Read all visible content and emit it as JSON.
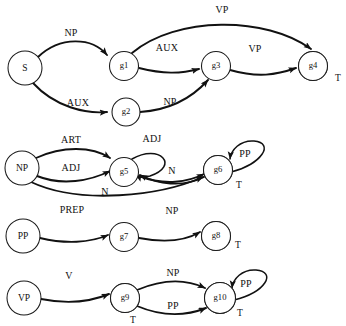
{
  "figure": {
    "kind": "recursive-transition-network",
    "background_color": "#ffffff",
    "node_fill": "#ffffff",
    "node_stroke": "#1a1a1a",
    "node_shade_color": "#b9b9b9",
    "edge_color": "#111111",
    "terminal_marker": "T"
  },
  "networks": [
    {
      "id": "s-network",
      "name": "S network",
      "nodes": [
        {
          "id": "S",
          "label": "S",
          "cx": 25,
          "cy": 68,
          "r": 17,
          "terminal": false
        },
        {
          "id": "g1",
          "label": "g1",
          "cx": 124,
          "cy": 66,
          "r": 14.5,
          "terminal": false
        },
        {
          "id": "g2",
          "label": "g2",
          "cx": 126,
          "cy": 112,
          "r": 14,
          "terminal": false
        },
        {
          "id": "g3",
          "label": "g3",
          "cx": 216,
          "cy": 66,
          "r": 14.5,
          "terminal": false
        },
        {
          "id": "g4",
          "label": "g4",
          "cx": 313,
          "cy": 66,
          "r": 14.5,
          "terminal": true,
          "terminal_label": "T",
          "terminal_label_x": 338,
          "terminal_label_y": 79
        }
      ],
      "edges": [
        {
          "from": "S",
          "to": "g1",
          "label": "NP",
          "label_x": 71,
          "label_y": 34
        },
        {
          "from": "S",
          "to": "g2",
          "label": "AUX",
          "label_x": 78,
          "label_y": 104
        },
        {
          "from": "g1",
          "to": "g3",
          "label": "AUX",
          "label_x": 167,
          "label_y": 49
        },
        {
          "from": "g1",
          "to": "g4",
          "label": "VP",
          "label_x": 222,
          "label_y": 11
        },
        {
          "from": "g2",
          "to": "g3",
          "label": "NP",
          "label_x": 170,
          "label_y": 103
        },
        {
          "from": "g3",
          "to": "g4",
          "label": "VP",
          "label_x": 255,
          "label_y": 50
        }
      ]
    },
    {
      "id": "np-network",
      "name": "NP network",
      "nodes": [
        {
          "id": "NP",
          "label": "NP",
          "cx": 22,
          "cy": 168,
          "r": 17,
          "terminal": false
        },
        {
          "id": "g5",
          "label": "g5",
          "cx": 124,
          "cy": 172,
          "r": 14.5,
          "terminal": false
        },
        {
          "id": "g6",
          "label": "g6",
          "cx": 218,
          "cy": 170,
          "r": 14.5,
          "terminal": true,
          "terminal_label": "T",
          "terminal_label_x": 239,
          "terminal_label_y": 186
        }
      ],
      "edges": [
        {
          "from": "NP",
          "to": "g5",
          "label": "ART",
          "label_x": 71,
          "label_y": 141
        },
        {
          "from": "NP",
          "to": "g5",
          "label": "ADJ",
          "label_x": 71,
          "label_y": 169
        },
        {
          "from": "NP",
          "to": "g6",
          "label": "N",
          "label_x": 105,
          "label_y": 193
        },
        {
          "from": "g5",
          "to": "g5",
          "label": "ADJ",
          "label_x": 152,
          "label_y": 140
        },
        {
          "from": "g5",
          "to": "g6",
          "label": "N",
          "label_x": 172,
          "label_y": 172
        },
        {
          "from": "g6",
          "to": "g6",
          "label": "PP",
          "label_x": 245,
          "label_y": 155
        }
      ]
    },
    {
      "id": "pp-network",
      "name": "PP network",
      "nodes": [
        {
          "id": "PP",
          "label": "PP",
          "cx": 23,
          "cy": 236,
          "r": 17,
          "terminal": false
        },
        {
          "id": "g7",
          "label": "g7",
          "cx": 124,
          "cy": 237,
          "r": 14.5,
          "terminal": false
        },
        {
          "id": "g8",
          "label": "g8",
          "cx": 216,
          "cy": 236,
          "r": 14.5,
          "terminal": true,
          "terminal_label": "T",
          "terminal_label_x": 238,
          "terminal_label_y": 246
        }
      ],
      "edges": [
        {
          "from": "PP",
          "to": "g7",
          "label": "PREP",
          "label_x": 72,
          "label_y": 211
        },
        {
          "from": "g7",
          "to": "g8",
          "label": "NP",
          "label_x": 172,
          "label_y": 212
        }
      ]
    },
    {
      "id": "vp-network",
      "name": "VP network",
      "nodes": [
        {
          "id": "VP",
          "label": "VP",
          "cx": 24,
          "cy": 298,
          "r": 17,
          "terminal": false
        },
        {
          "id": "g9",
          "label": "g9",
          "cx": 125,
          "cy": 298,
          "r": 14.5,
          "terminal": true,
          "terminal_label": "T",
          "terminal_label_x": 133,
          "terminal_label_y": 321
        },
        {
          "id": "g10",
          "label": "g10",
          "cx": 220,
          "cy": 298,
          "r": 15.5,
          "terminal": true,
          "terminal_label": "T",
          "terminal_label_x": 240,
          "terminal_label_y": 314
        }
      ],
      "edges": [
        {
          "from": "VP",
          "to": "g9",
          "label": "V",
          "label_x": 69,
          "label_y": 277
        },
        {
          "from": "g9",
          "to": "g10",
          "label": "NP",
          "label_x": 173,
          "label_y": 274
        },
        {
          "from": "g9",
          "to": "g10",
          "label": "PP",
          "label_x": 173,
          "label_y": 307
        },
        {
          "from": "g10",
          "to": "g10",
          "label": "PP",
          "label_x": 246,
          "label_y": 285
        }
      ]
    }
  ]
}
